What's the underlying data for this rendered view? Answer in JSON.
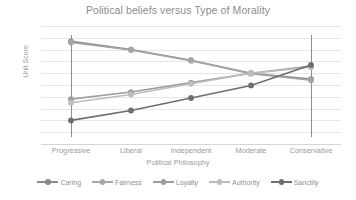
{
  "chart_data": {
    "type": "line",
    "title": "Political beliefs versus Type of Morality",
    "xlabel": "Political Philosophy",
    "ylabel": "Unit Score",
    "categories": [
      "Progressive",
      "Liberal",
      "Independent",
      "Moderate",
      "Conservative"
    ],
    "yticks": [
      "5",
      "4.5",
      "4",
      "3.5",
      "3",
      "2.5",
      "2",
      "1.5",
      "1",
      "0.5",
      "0"
    ],
    "ylim": [
      0,
      5
    ],
    "ystep": 0.5,
    "grid": true,
    "legend_position": "bottom",
    "series": [
      {
        "name": "Caring",
        "values": [
          4.35,
          4.0,
          3.55,
          3.0,
          2.75
        ],
        "color": "#8c8c8c"
      },
      {
        "name": "Fairness",
        "values": [
          4.3,
          3.98,
          3.53,
          2.98,
          2.7
        ],
        "color": "#a6a6a6"
      },
      {
        "name": "Loyalty",
        "values": [
          1.9,
          2.2,
          2.6,
          3.0,
          3.3
        ],
        "color": "#9e9e9e"
      },
      {
        "name": "Authority",
        "values": [
          1.75,
          2.1,
          2.55,
          3.0,
          3.25
        ],
        "color": "#bdbdbd"
      },
      {
        "name": "Sanctity",
        "values": [
          1.0,
          1.42,
          1.95,
          2.48,
          3.35
        ],
        "color": "#6e6e6e"
      }
    ],
    "reference_lines": [
      {
        "at": "Progressive",
        "color": "#8e8e8e"
      },
      {
        "at": "Conservative",
        "color": "#8e8e8e"
      }
    ]
  }
}
